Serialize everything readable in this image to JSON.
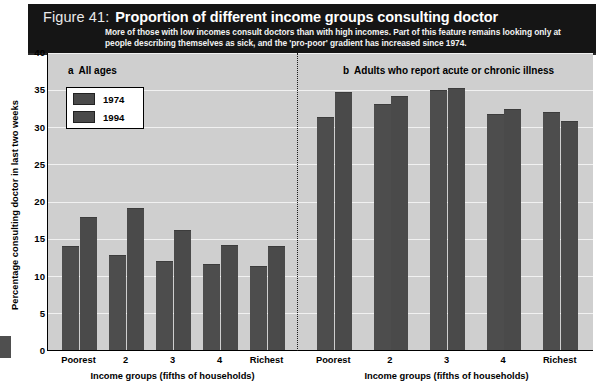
{
  "figure": {
    "number": "Figure 41:",
    "title": "Proportion of different income groups consulting doctor",
    "subtitle": "More of those with low incomes consult doctors than with high incomes. Part of this feature remains looking only at people describing themselves as sick, and the 'pro-poor' gradient has increased since 1974."
  },
  "legend": {
    "items": [
      {
        "label": "1974",
        "color": "#4d4d4d"
      },
      {
        "label": "1994",
        "color": "#4a4a4a"
      }
    ]
  },
  "axes": {
    "y_title": "Percentage consulting doctor in last two weeks",
    "y_ticks": [
      "0",
      "5",
      "10",
      "15",
      "20",
      "25",
      "30",
      "35",
      "40"
    ],
    "x_title_left": "Income groups (fifths of households)",
    "x_title_right": "Income groups (fifths of households)",
    "x_categories": [
      "Poorest",
      "2",
      "3",
      "4",
      "Richest"
    ]
  },
  "panels": [
    {
      "letter": "a",
      "heading": "All ages"
    },
    {
      "letter": "b",
      "heading": "Adults who report acute or chronic illness"
    }
  ],
  "chart_data": {
    "type": "bar",
    "title": "Proportion of different income groups consulting doctor",
    "subtitle": "More of those with low incomes consult doctors than with high incomes. Part of this feature remains looking only at people describing themselves as sick, and the 'pro-poor' gradient has increased since 1974.",
    "xlabel": "Income groups (fifths of households)",
    "ylabel": "Percentage consulting doctor in last two weeks",
    "ylim": [
      0,
      40
    ],
    "ytick_step": 5,
    "grid": true,
    "legend_position": "top-left",
    "panels": [
      {
        "panel": "a",
        "panel_title": "All ages",
        "categories": [
          "Poorest",
          "2",
          "3",
          "4",
          "Richest"
        ],
        "series": [
          {
            "name": "1974",
            "values": [
              14.0,
              12.8,
              11.9,
              11.5,
              11.3
            ]
          },
          {
            "name": "1994",
            "values": [
              17.8,
              19.0,
              16.1,
              14.1,
              14.0
            ]
          }
        ]
      },
      {
        "panel": "b",
        "panel_title": "Adults who report acute or chronic illness",
        "categories": [
          "Poorest",
          "2",
          "3",
          "4",
          "Richest"
        ],
        "series": [
          {
            "name": "1974",
            "values": [
              31.3,
              33.0,
              34.9,
              31.7,
              32.0
            ]
          },
          {
            "name": "1994",
            "values": [
              34.7,
              34.1,
              35.2,
              32.4,
              30.8
            ]
          }
        ]
      }
    ]
  },
  "colors": {
    "banner_bg": "#151515",
    "plot_bg": "#cfcfcf",
    "gridline": "#f1f1f1",
    "bar_1974": "#4d4d4d",
    "bar_1994": "#4a4a4a"
  }
}
